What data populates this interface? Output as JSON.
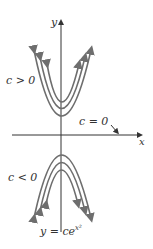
{
  "figure": {
    "axis_x_label": "x",
    "axis_y_label": "y",
    "label_c_pos": "c > 0",
    "label_c_zero": "c = 0",
    "label_c_neg": "c < 0",
    "equation": "y = ce",
    "equation_exp": "x²",
    "colors": {
      "curve": "#6e6e6e",
      "axis": "#333333"
    }
  }
}
